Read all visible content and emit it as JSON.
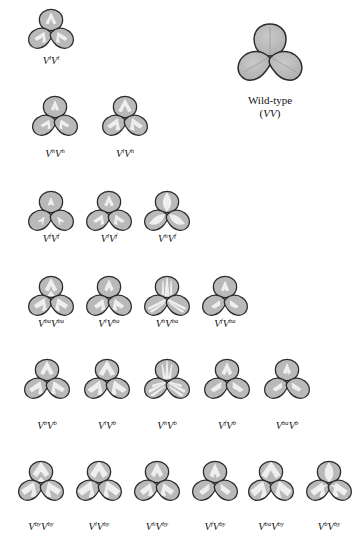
{
  "figure": {
    "background_color": "#ffffff",
    "outline_color": "#2b2b2b",
    "leaf_fill_color": "#b9b9b9",
    "pattern_color": "#f2f2f2",
    "wildtype": {
      "caption_line1": "Wild-type",
      "caption_line2_open": "(",
      "caption_line2_gene": "VV",
      "caption_line2_close": ")",
      "pattern": "plain"
    },
    "rows": [
      {
        "row_name": "row-l",
        "top": 8,
        "label_top": 55,
        "specimens": [
          {
            "name": "specimen-vl-vl",
            "left": 22,
            "allele_left": "l",
            "allele_right": "l",
            "label_plain": "V l V l",
            "pattern": "v-chevron-white"
          }
        ]
      },
      {
        "row_name": "row-h",
        "top": 95,
        "label_top": 148,
        "specimens": [
          {
            "name": "specimen-vh-vh",
            "left": 26,
            "allele_left": "h",
            "allele_right": "h",
            "label_plain": "V h V h",
            "pattern": "narrow-v"
          },
          {
            "name": "specimen-vl-vh",
            "left": 96,
            "allele_left": "l",
            "allele_right": "h",
            "label_plain": "V l V h",
            "pattern": "broad-v"
          }
        ]
      },
      {
        "row_name": "row-f",
        "top": 190,
        "label_top": 233,
        "specimens": [
          {
            "name": "specimen-vf-vf",
            "left": 22,
            "allele_left": "f",
            "allele_right": "f",
            "label_plain": "V f V f",
            "pattern": "faint-fleck"
          },
          {
            "name": "specimen-vl-vf",
            "left": 80,
            "allele_left": "l",
            "allele_right": "f",
            "label_plain": "V l V f",
            "pattern": "mid-fleck"
          },
          {
            "name": "specimen-vh-vf",
            "left": 138,
            "allele_left": "h",
            "allele_right": "f",
            "label_plain": "V h V f",
            "pattern": "pale-center"
          }
        ]
      },
      {
        "row_name": "row-ba",
        "top": 275,
        "label_top": 318,
        "specimens": [
          {
            "name": "specimen-vba-vba",
            "left": 22,
            "allele_left": "ba",
            "allele_right": "ba",
            "label_plain": "V ba V ba",
            "pattern": "banded"
          },
          {
            "name": "specimen-vl-vba",
            "left": 80,
            "allele_left": "l",
            "allele_right": "ba",
            "label_plain": "V l V ba",
            "pattern": "banded-narrow"
          },
          {
            "name": "specimen-vh-vba",
            "left": 138,
            "allele_left": "h",
            "allele_right": "ba",
            "label_plain": "V h V ba",
            "pattern": "striped"
          },
          {
            "name": "specimen-vf-vba",
            "left": 196,
            "allele_left": "f",
            "allele_right": "ba",
            "label_plain": "V f V ba",
            "pattern": "banded-faint"
          }
        ]
      },
      {
        "row_name": "row-b",
        "top": 358,
        "label_top": 420,
        "specimens": [
          {
            "name": "specimen-vb-vb",
            "left": 18,
            "allele_left": "b",
            "allele_right": "b",
            "label_plain": "V b V b",
            "pattern": "broad-band"
          },
          {
            "name": "specimen-vl-vb",
            "left": 78,
            "allele_left": "l",
            "allele_right": "b",
            "label_plain": "V l V b",
            "pattern": "broad-band-wide"
          },
          {
            "name": "specimen-vh-vb",
            "left": 138,
            "allele_left": "h",
            "allele_right": "b",
            "label_plain": "V h V b",
            "pattern": "radiate"
          },
          {
            "name": "specimen-vf-vb",
            "left": 198,
            "allele_left": "f",
            "allele_right": "b",
            "label_plain": "V f V b",
            "pattern": "soft-band"
          },
          {
            "name": "specimen-vba-vb",
            "left": 258,
            "allele_left": "ba",
            "allele_right": "b",
            "label_plain": "V ba V b",
            "pattern": "tight-band"
          }
        ]
      },
      {
        "row_name": "row-by",
        "top": 460,
        "label_top": 521,
        "specimens": [
          {
            "name": "specimen-vby-vby",
            "left": 12,
            "allele_left": "by",
            "allele_right": "by",
            "label_plain": "V by V by",
            "pattern": "chevron-bold"
          },
          {
            "name": "specimen-vl-vby",
            "left": 70,
            "allele_left": "l",
            "allele_right": "by",
            "label_plain": "V l V by",
            "pattern": "chevron-wide"
          },
          {
            "name": "specimen-vh-vby",
            "left": 128,
            "allele_left": "h",
            "allele_right": "by",
            "label_plain": "V h V by",
            "pattern": "chevron-narrow"
          },
          {
            "name": "specimen-vf-vby",
            "left": 186,
            "allele_left": "f",
            "allele_right": "by",
            "label_plain": "V f V by",
            "pattern": "chevron-soft"
          },
          {
            "name": "specimen-vba-vby",
            "left": 242,
            "allele_left": "ba",
            "allele_right": "by",
            "label_plain": "V ba V by",
            "pattern": "chevron-broad"
          },
          {
            "name": "specimen-vb-vby",
            "left": 300,
            "allele_left": "b",
            "allele_right": "by",
            "label_plain": "V b V by",
            "pattern": "chevron-dense"
          }
        ]
      }
    ]
  }
}
